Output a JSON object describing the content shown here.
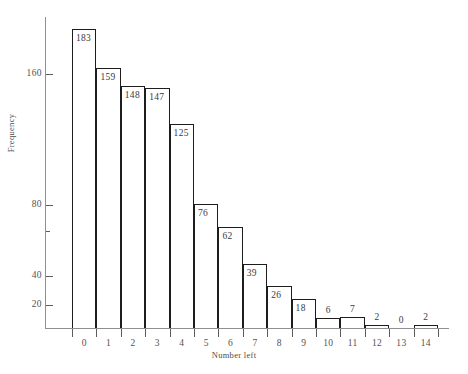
{
  "chart_data": {
    "type": "bar",
    "title": "",
    "subtitle": "",
    "xlabel": "Number left",
    "ylabel": "Frequency",
    "categories": [
      "0",
      "1",
      "2",
      "3",
      "4",
      "5",
      "6",
      "7",
      "8",
      "9",
      "10",
      "11",
      "12",
      "13",
      "14"
    ],
    "values": [
      183,
      159,
      148,
      147,
      125,
      76,
      62,
      39,
      26,
      18,
      6,
      7,
      2,
      0,
      2
    ],
    "data_labels": [
      "183",
      "159",
      "148",
      "147",
      "125",
      "76",
      "62",
      "39",
      "26",
      "18",
      "6",
      "7",
      "2",
      "0",
      "2"
    ],
    "ylim": [
      0,
      195
    ],
    "xlim": [
      0,
      15
    ],
    "y_ticks": [
      20,
      40,
      80,
      160
    ],
    "y_tick_labels": [
      "20",
      "40",
      "80",
      "160"
    ],
    "y_unlabeled_ticks": [
      60
    ],
    "x_ticks": [
      "0",
      "1",
      "2",
      "3",
      "4",
      "5",
      "6",
      "7",
      "8",
      "9",
      "10",
      "11",
      "12",
      "13",
      "14"
    ],
    "grid": false,
    "legend": null,
    "legend_position": "none",
    "bar_style": "outline",
    "bar_edge_color": "#1d1d1d",
    "bar_fill_color": "#ffffff",
    "axis_color": "#8f8f8f",
    "text_color": "#4f4c49"
  },
  "axes": {
    "y_title": "Frequency",
    "x_title": "Number left"
  }
}
